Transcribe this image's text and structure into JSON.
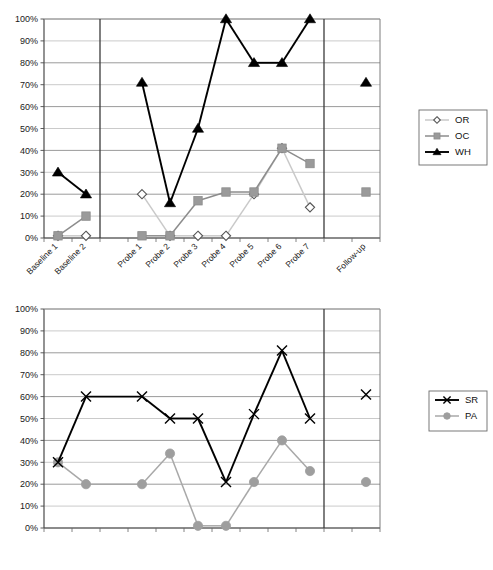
{
  "figure": {
    "title": "",
    "charts": [
      {
        "id": "top",
        "legend_position": "right"
      },
      {
        "id": "bottom",
        "legend_position": "right"
      }
    ]
  },
  "axis": {
    "y_ticks": [
      "0%",
      "10%",
      "20%",
      "30%",
      "40%",
      "50%",
      "60%",
      "70%",
      "80%",
      "90%",
      "100%"
    ],
    "categories": [
      "Baseline 1",
      "Baseline 2",
      "Probe 1",
      "Probe 2",
      "Probe 3",
      "Probe 4",
      "Probe 5",
      "Probe 6",
      "Probe 7",
      "Follow-up"
    ]
  },
  "legend_top": [
    {
      "label": "OR",
      "marker": "open-diamond",
      "color": "#c9c9c9",
      "marker_fill": "#ffffff",
      "marker_stroke": "#555555"
    },
    {
      "label": "OC",
      "marker": "filled-square",
      "color": "#8c8c8c",
      "marker_fill": "#9a9a9a",
      "marker_stroke": "#8c8c8c"
    },
    {
      "label": "WH",
      "marker": "filled-triangle",
      "color": "#000000",
      "marker_fill": "#000000",
      "marker_stroke": "#000000"
    }
  ],
  "legend_bottom": [
    {
      "label": "SR",
      "marker": "cross-x",
      "color": "#000000",
      "marker_fill": "#000000",
      "marker_stroke": "#000000"
    },
    {
      "label": "PA",
      "marker": "filled-circle",
      "color": "#a8a8a8",
      "marker_fill": "#9e9e9e",
      "marker_stroke": "#9e9e9e"
    }
  ],
  "chart_data": [
    {
      "type": "line",
      "id": "top-chart",
      "title": "",
      "xlabel": "",
      "ylabel": "",
      "ylim": [
        0,
        100
      ],
      "grid": true,
      "legend": "right",
      "categories": [
        "Baseline 1",
        "Baseline 2",
        "Probe 1",
        "Probe 2",
        "Probe 3",
        "Probe 4",
        "Probe 5",
        "Probe 6",
        "Probe 7",
        "Follow-up"
      ],
      "phase_dividers": [
        "after Baseline 2",
        "after Probe 7"
      ],
      "series": [
        {
          "name": "OR",
          "marker": "open-diamond",
          "values": [
            1,
            1,
            20,
            1,
            1,
            1,
            20,
            41,
            14,
            null
          ]
        },
        {
          "name": "OC",
          "marker": "filled-square",
          "values": [
            1,
            10,
            1,
            1,
            17,
            21,
            21,
            41,
            34,
            21
          ]
        },
        {
          "name": "WH",
          "marker": "filled-triangle",
          "values": [
            30,
            20,
            71,
            16,
            50,
            100,
            80,
            80,
            100,
            71
          ]
        }
      ]
    },
    {
      "type": "line",
      "id": "bottom-chart",
      "title": "",
      "xlabel": "",
      "ylabel": "",
      "ylim": [
        0,
        100
      ],
      "grid": true,
      "legend": "right",
      "categories": [
        "Baseline 1",
        "Baseline 2",
        "Probe 1",
        "Probe 2",
        "Probe 3",
        "Probe 4",
        "Probe 5",
        "Probe 6",
        "Probe 7",
        "Follow-up"
      ],
      "phase_dividers": [
        "after Probe 7"
      ],
      "series": [
        {
          "name": "SR",
          "marker": "cross-x",
          "values": [
            30,
            60,
            60,
            50,
            50,
            21,
            52,
            81,
            50,
            61
          ]
        },
        {
          "name": "PA",
          "marker": "filled-circle",
          "values": [
            30,
            20,
            20,
            34,
            1,
            1,
            21,
            40,
            26,
            21
          ]
        }
      ]
    }
  ]
}
